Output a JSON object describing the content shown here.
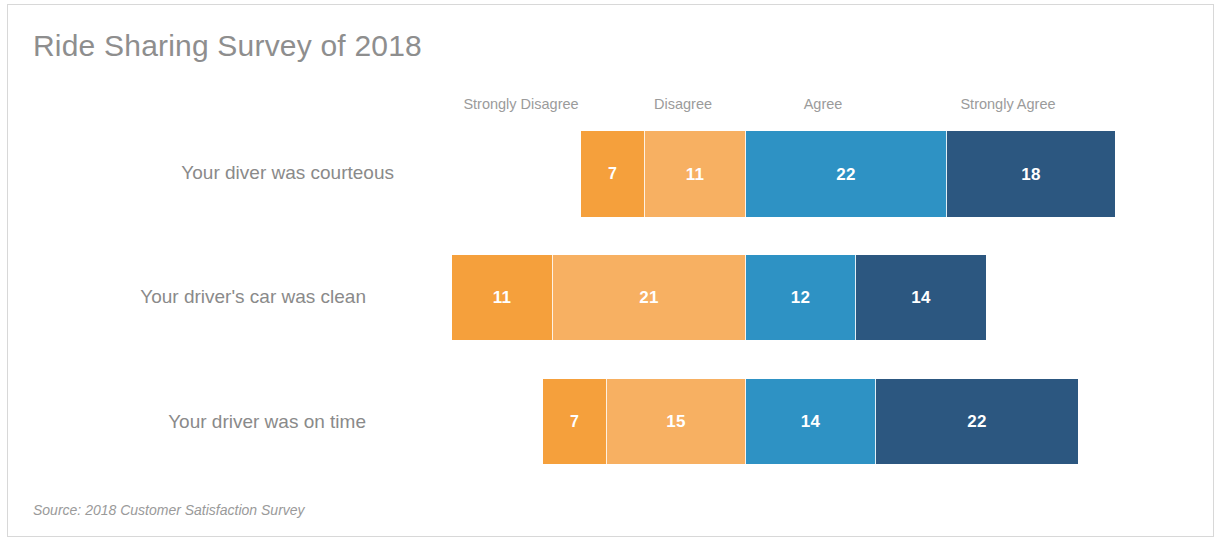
{
  "slide": {
    "title": "Ride Sharing Survey of 2018",
    "source_note": "Source: 2018 Customer Satisfaction Survey",
    "title_color": "#8e8e8e",
    "label_color": "#8a8a8a",
    "background": "#ffffff"
  },
  "chart_data": {
    "type": "bar",
    "subtype": "diverging-stacked-likert",
    "title": "Ride Sharing Survey of 2018",
    "xlabel": "",
    "ylabel": "",
    "grid": false,
    "legend_position": "top",
    "annotations": [
      "Source: 2018 Customer Satisfaction Survey"
    ],
    "categories": [
      "Your diver was courteous",
      "Your driver's car was clean",
      "Your driver was on time"
    ],
    "legend": [
      "Strongly Disagree",
      "Disagree",
      "Agree",
      "Strongly Agree"
    ],
    "colors": [
      "#f5a03c",
      "#f7b062",
      "#2e92c4",
      "#2c5780"
    ],
    "series": [
      {
        "name": "Strongly Disagree",
        "color": "#f5a03c",
        "values": [
          7,
          11,
          7
        ]
      },
      {
        "name": "Disagree",
        "color": "#f7b062",
        "values": [
          11,
          21,
          15
        ]
      },
      {
        "name": "Agree",
        "color": "#2e92c4",
        "values": [
          22,
          12,
          14
        ]
      },
      {
        "name": "Strongly Agree",
        "color": "#2c5780",
        "values": [
          18,
          14,
          22
        ]
      }
    ]
  },
  "headers": [
    {
      "label": "Strongly Disagree",
      "center_x": 521
    },
    {
      "label": "Disagree",
      "center_x": 683
    },
    {
      "label": "Agree",
      "center_x": 823
    },
    {
      "label": "Strongly Agree",
      "center_x": 1008
    }
  ],
  "rows": [
    {
      "label": "Your diver was courteous",
      "label_right_x": 394,
      "center_y": 173,
      "bar_left": 581,
      "bar_top": 131,
      "bar_height": 86,
      "segments": [
        {
          "name": "Strongly Disagree",
          "value": 7,
          "color": "#f5a03c",
          "width": 64
        },
        {
          "name": "Disagree",
          "value": 11,
          "color": "#f7b062",
          "width": 101
        },
        {
          "name": "Agree",
          "value": 22,
          "color": "#2e92c4",
          "width": 201
        },
        {
          "name": "Strongly Agree",
          "value": 18,
          "color": "#2c5780",
          "width": 168
        }
      ]
    },
    {
      "label": "Your driver's car was clean",
      "label_right_x": 366,
      "center_y": 297,
      "bar_left": 452,
      "bar_top": 255,
      "bar_height": 85,
      "segments": [
        {
          "name": "Strongly Disagree",
          "value": 11,
          "color": "#f5a03c",
          "width": 101
        },
        {
          "name": "Disagree",
          "value": 21,
          "color": "#f7b062",
          "width": 193
        },
        {
          "name": "Agree",
          "value": 12,
          "color": "#2e92c4",
          "width": 110
        },
        {
          "name": "Strongly Agree",
          "value": 14,
          "color": "#2c5780",
          "width": 130
        }
      ]
    },
    {
      "label": "Your driver was on time",
      "label_right_x": 366,
      "center_y": 422,
      "bar_left": 543,
      "bar_top": 379,
      "bar_height": 85,
      "segments": [
        {
          "name": "Strongly Disagree",
          "value": 7,
          "color": "#f5a03c",
          "width": 64
        },
        {
          "name": "Disagree",
          "value": 15,
          "color": "#f7b062",
          "width": 139
        },
        {
          "name": "Agree",
          "value": 14,
          "color": "#2e92c4",
          "width": 130
        },
        {
          "name": "Strongly Agree",
          "value": 22,
          "color": "#2c5780",
          "width": 202
        }
      ]
    }
  ]
}
